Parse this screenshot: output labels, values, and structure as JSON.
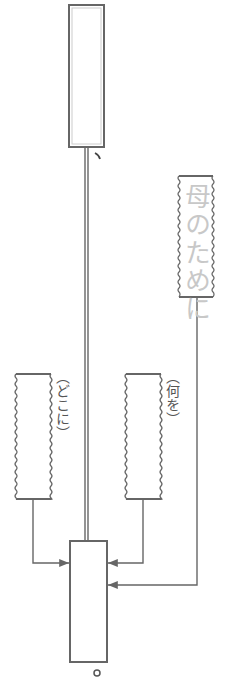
{
  "diagram": {
    "type": "sentence-structure-worksheet",
    "orientation": "vertical",
    "boxes": {
      "subject_box": {
        "role": "top answer box",
        "content": ""
      },
      "modifier_box": {
        "role": "given phrase",
        "content": "母のために"
      },
      "where_box": {
        "role": "answer box",
        "hint": "（どこに）",
        "content": ""
      },
      "what_box": {
        "role": "answer box",
        "hint": "（何を）",
        "content": ""
      },
      "predicate_box": {
        "role": "bottom answer box",
        "content": ""
      }
    },
    "punctuation": {
      "after_subject": "、",
      "after_predicate": "。"
    },
    "colors": {
      "line": "#666666",
      "hint_text": "#555555",
      "given_text": "#c8c8c8"
    }
  }
}
